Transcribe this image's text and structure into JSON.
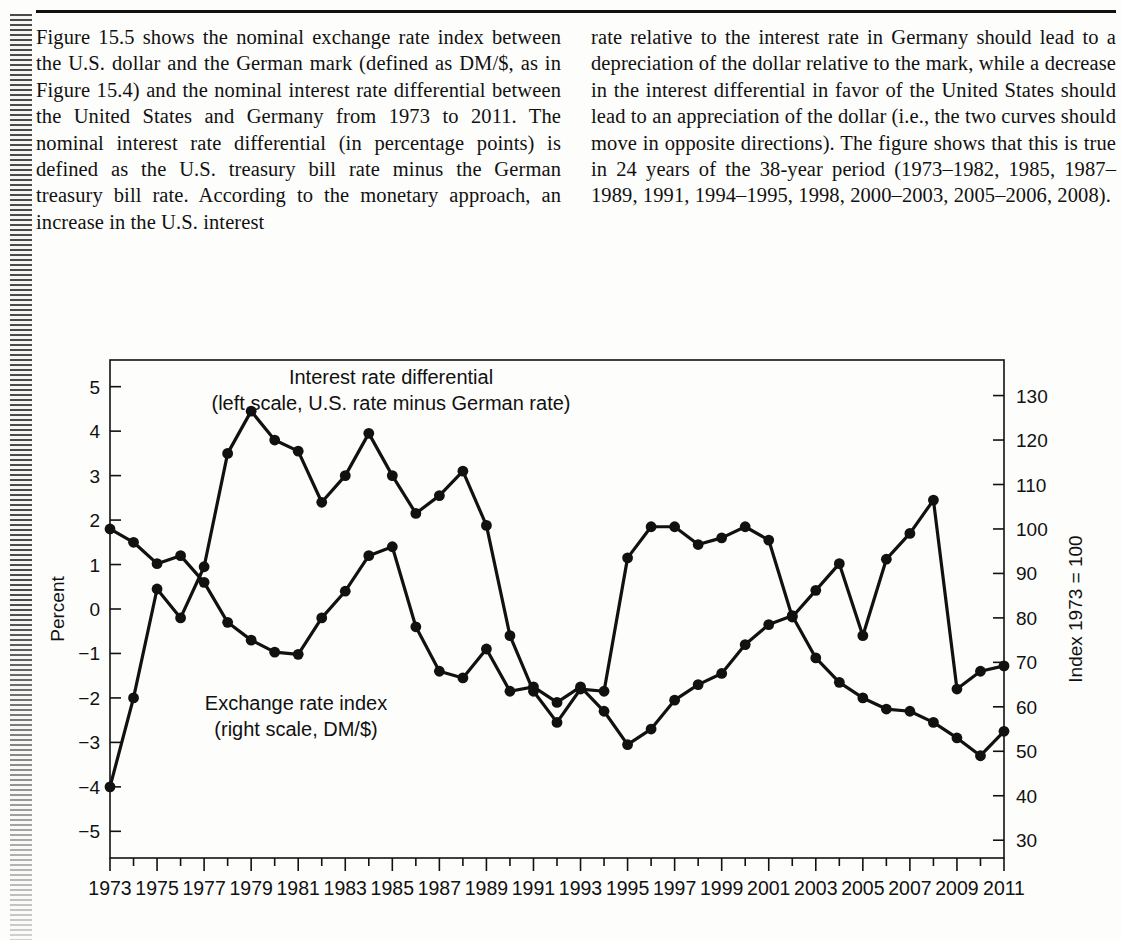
{
  "page": {
    "left_column_text": "Figure 15.5 shows the nominal exchange rate index between the U.S. dollar and the German mark (defined as DM/$, as in Figure 15.4) and the nominal interest rate differential between the United States and Germany from 1973 to 2011. The nominal interest rate differential (in percentage points) is defined as the U.S. treasury bill rate minus the German treasury bill rate. According to the monetary approach, an increase in the U.S. interest",
    "right_column_text": "rate relative to the interest rate in Germany should lead to a depreciation of the dollar relative to the mark, while a decrease in the interest differential in favor of the United States should lead to an appreciation of the dollar (i.e., the two curves should move in opposite directions). The figure shows that this is true in 24 years of the 38-year period (1973–1982, 1985, 1987–1989, 1991, 1994–1995, 1998, 2000–2003, 2005–2006, 2008)."
  },
  "chart_data": {
    "type": "line",
    "title": "",
    "xlabel": "",
    "ylabel": "Percent",
    "y2label": "Index 1973 = 100",
    "grid": false,
    "legend_position": "inline-annotations",
    "x": [
      1973,
      1974,
      1975,
      1976,
      1977,
      1978,
      1979,
      1980,
      1981,
      1982,
      1983,
      1984,
      1985,
      1986,
      1987,
      1988,
      1989,
      1990,
      1991,
      1992,
      1993,
      1994,
      1995,
      1996,
      1997,
      1998,
      1999,
      2000,
      2001,
      2002,
      2003,
      2004,
      2005,
      2006,
      2007,
      2008,
      2009,
      2010,
      2011
    ],
    "xticklabels": [
      "1973",
      "1975",
      "1977",
      "1979",
      "1981",
      "1983",
      "1985",
      "1987",
      "1989",
      "1991",
      "1993",
      "1995",
      "1997",
      "1999",
      "2001",
      "2003",
      "2005",
      "2007",
      "2009",
      "2011"
    ],
    "ylim": [
      -5.6,
      5.6
    ],
    "yticks": [
      5,
      4,
      3,
      2,
      1,
      0,
      -1,
      -2,
      -3,
      -4,
      -5
    ],
    "yticklabels": [
      "5",
      "4",
      "3",
      "2",
      "1",
      "0",
      "−1",
      "−2",
      "−3",
      "−4",
      "−5"
    ],
    "y2lim": [
      26,
      138
    ],
    "y2ticks": [
      130,
      120,
      110,
      100,
      90,
      80,
      70,
      60,
      50,
      40,
      30
    ],
    "y2ticklabels": [
      "130",
      "120",
      "110",
      "100",
      "90",
      "80",
      "70",
      "60",
      "50",
      "40",
      "30"
    ],
    "series": [
      {
        "name": "Interest rate differential",
        "annotation_line1": "Interest rate differential",
        "annotation_line2": "(left scale, U.S. rate minus German rate)",
        "axis": "left",
        "marker": "filled-circle",
        "values": [
          -4.0,
          -2.0,
          0.45,
          -0.2,
          0.95,
          3.5,
          4.45,
          3.8,
          3.55,
          2.4,
          3.0,
          3.95,
          3.0,
          2.15,
          2.55,
          3.1,
          1.88,
          -0.6,
          -1.85,
          -2.55,
          -1.8,
          -1.85,
          1.15,
          1.85,
          1.85,
          1.45,
          1.6,
          1.85,
          1.55,
          -0.18,
          0.42,
          1.02,
          -0.6,
          1.12,
          1.7,
          2.45,
          -1.8,
          -1.4,
          -1.28
        ]
      },
      {
        "name": "Exchange rate index",
        "annotation_line1": "Exchange rate index",
        "annotation_line2": "(right scale, DM/$)",
        "axis": "right",
        "marker": "filled-circle",
        "values": [
          100.0,
          97.0,
          92.2,
          94.0,
          88.0,
          79.0,
          75.0,
          72.3,
          71.8,
          80.0,
          86.0,
          94.0,
          96.0,
          78.0,
          68.0,
          66.5,
          73.0,
          63.5,
          64.5,
          61.0,
          64.5,
          59.0,
          51.5,
          55.0,
          61.5,
          65.0,
          67.5,
          74.0,
          78.5,
          80.5,
          71.0,
          65.5,
          62.0,
          59.5,
          59.0,
          56.5,
          53.0,
          49.0,
          54.5
        ]
      }
    ]
  }
}
